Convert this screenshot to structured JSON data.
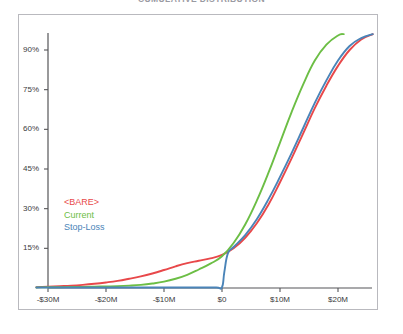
{
  "chart_title": "CUMULATIVE DISTRIBUTION",
  "legend": {
    "bare": "<BARE>",
    "current": "Current",
    "stop_loss": "Stop-Loss"
  },
  "colors": {
    "bare": "#e8484a",
    "current": "#6cbe45",
    "stop_loss": "#4a84b8",
    "axis": "#555558",
    "frame": "#b9b9be",
    "tick_text": "#3a3a3c"
  },
  "chart_data": {
    "type": "line",
    "title": "CUMULATIVE DISTRIBUTION",
    "xlabel": "",
    "ylabel": "",
    "grid": false,
    "legend_position": "inside-left",
    "xlim": [
      -32,
      26
    ],
    "ylim": [
      0,
      97
    ],
    "x_tick_labels": [
      "-$30M",
      "-$20M",
      "-$10M",
      "$0",
      "$10M",
      "$20M"
    ],
    "x_tick_values": [
      -30,
      -20,
      -10,
      0,
      10,
      20
    ],
    "y_tick_labels": [
      "15%",
      "30%",
      "45%",
      "60%",
      "75%",
      "90%"
    ],
    "y_tick_values": [
      15,
      30,
      45,
      60,
      75,
      90
    ],
    "x_unit": "USD millions",
    "y_unit": "percent",
    "series": [
      {
        "name": "<BARE>",
        "color": "#e8484a",
        "x": [
          -32,
          -30,
          -28,
          -26,
          -24,
          -22,
          -20,
          -18,
          -16,
          -14,
          -12,
          -10,
          -8,
          -6,
          -4,
          -2,
          0,
          2,
          4,
          6,
          8,
          10,
          12,
          14,
          16,
          18,
          20,
          22,
          24,
          26
        ],
        "values": [
          0.3,
          0.5,
          0.7,
          0.9,
          1.2,
          1.6,
          2.1,
          2.7,
          3.5,
          4.4,
          5.5,
          6.8,
          8.2,
          9.4,
          10.3,
          11.2,
          12.5,
          15.0,
          19.0,
          24.5,
          31.5,
          40.0,
          49.0,
          58.5,
          68.0,
          76.5,
          84.0,
          90.0,
          94.0,
          96.0
        ]
      },
      {
        "name": "Current",
        "color": "#6cbe45",
        "x": [
          -32,
          -30,
          -28,
          -26,
          -24,
          -22,
          -20,
          -18,
          -16,
          -14,
          -12,
          -10,
          -8,
          -6,
          -4,
          -2,
          0,
          2,
          4,
          6,
          8,
          10,
          12,
          14,
          16,
          18,
          20,
          21
        ],
        "values": [
          0.2,
          0.3,
          0.3,
          0.4,
          0.4,
          0.5,
          0.6,
          0.7,
          0.9,
          1.2,
          1.7,
          2.4,
          3.5,
          5.0,
          7.0,
          9.2,
          12.0,
          17.0,
          24.0,
          33.0,
          43.5,
          55.0,
          66.5,
          77.0,
          86.0,
          92.0,
          95.5,
          96.0
        ]
      },
      {
        "name": "Stop-Loss",
        "color": "#4a84b8",
        "x": [
          -32,
          -20,
          -10,
          -4,
          -1,
          0,
          0.4,
          1,
          2,
          4,
          6,
          8,
          10,
          12,
          14,
          16,
          18,
          20,
          22,
          24,
          26
        ],
        "values": [
          0.2,
          0.2,
          0.2,
          0.2,
          0.2,
          0.3,
          6.0,
          13.0,
          15.5,
          20.0,
          26.0,
          33.5,
          42.0,
          51.0,
          60.5,
          70.0,
          78.5,
          86.0,
          91.5,
          94.5,
          96.0
        ]
      }
    ],
    "annotations": [
      "Stop-Loss series has a near-vertical discontinuity at $0, rising from ~0% to ~13%"
    ]
  }
}
